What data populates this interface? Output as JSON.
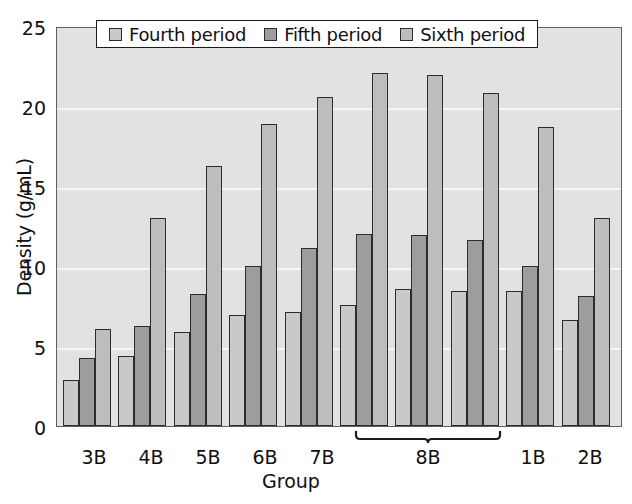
{
  "chart_data": {
    "type": "bar",
    "title": "",
    "xlabel": "Group",
    "ylabel": "Density (g/mL)",
    "ylim": [
      0,
      25
    ],
    "yticks": [
      0,
      5,
      10,
      15,
      20,
      25
    ],
    "grid": true,
    "legend_position": "top-center",
    "categories": [
      "3B",
      "4B",
      "5B",
      "6B",
      "7B",
      "8B",
      "8B",
      "8B",
      "1B",
      "2B"
    ],
    "category_labels": [
      "3B",
      "4B",
      "5B",
      "6B",
      "7B",
      "8B",
      "1B",
      "2B"
    ],
    "bracket_label": "8B",
    "bracket_spans_groups": 3,
    "series": [
      {
        "name": "Fourth period",
        "color": "#c9c9c9",
        "values": [
          2.9,
          4.4,
          5.9,
          7.0,
          7.2,
          7.6,
          8.6,
          8.5,
          8.5,
          6.7
        ]
      },
      {
        "name": "Fifth period",
        "color": "#9d9d9d",
        "values": [
          4.3,
          6.3,
          8.3,
          10.1,
          11.2,
          12.1,
          12.0,
          11.7,
          10.1,
          8.2
        ]
      },
      {
        "name": "Sixth period",
        "color": "#bdbdbd",
        "values": [
          6.1,
          13.1,
          16.4,
          19.0,
          20.7,
          22.2,
          22.1,
          21.0,
          18.8,
          13.1
        ]
      }
    ]
  },
  "axes": {
    "y_ticks": [
      "25",
      "20",
      "15",
      "10",
      "5",
      "0"
    ],
    "y_title": "Density (g/mL)",
    "x_title": "Group",
    "x_ticks": [
      "3B",
      "4B",
      "5B",
      "6B",
      "7B",
      "8B",
      "1B",
      "2B"
    ]
  },
  "legend": {
    "items": [
      {
        "label": "Fourth period",
        "color": "#c9c9c9"
      },
      {
        "label": "Fifth period",
        "color": "#9d9d9d"
      },
      {
        "label": "Sixth period",
        "color": "#bdbdbd"
      }
    ]
  },
  "colors": {
    "plot_background": "#e2e2e2",
    "gridline": "#f6f6f6",
    "axis_line": "#5e5e5e",
    "bar_outline": "#2c2c2c",
    "text": "#101010"
  }
}
